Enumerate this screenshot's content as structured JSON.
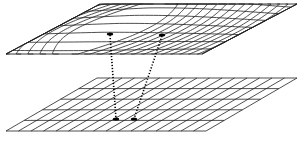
{
  "diagram": {
    "type": "mapping-between-surfaces",
    "colors": {
      "background": "#ffffff",
      "line": "#222222",
      "point": "#000000"
    },
    "top_surface": {
      "name": "warped-grid",
      "corners": {
        "tl": [
          100,
          4
        ],
        "tr": [
          297,
          4
        ],
        "br": [
          202,
          54
        ],
        "bl": [
          6,
          54
        ]
      },
      "points": [
        [
          110,
          34
        ],
        [
          162,
          35
        ]
      ]
    },
    "bottom_surface": {
      "name": "flat-grid",
      "corners": {
        "tl": [
          97,
          78
        ],
        "tr": [
          297,
          78
        ],
        "br": [
          206,
          131
        ],
        "bl": [
          6,
          131
        ]
      },
      "rows": 5,
      "cols": 16,
      "points": [
        [
          116,
          119
        ],
        [
          134,
          119
        ]
      ]
    },
    "connections": [
      {
        "from": [
          110,
          35
        ],
        "to": [
          116,
          119
        ],
        "style": "dotted"
      },
      {
        "from": [
          162,
          36
        ],
        "to": [
          134,
          119
        ],
        "style": "dotted"
      }
    ]
  }
}
